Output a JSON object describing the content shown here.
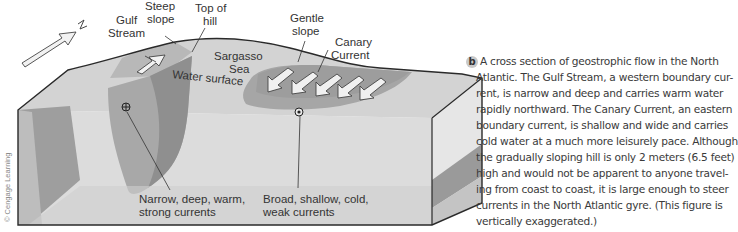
{
  "figure": {
    "labels": {
      "north_arrow": "N",
      "gulf_stream": [
        "Gulf",
        "Stream"
      ],
      "steep_slope": [
        "Steep",
        "slope"
      ],
      "top_of_hill": [
        "Top of",
        "hill"
      ],
      "gentle_slope": [
        "Gentle",
        "slope"
      ],
      "canary_current": [
        "Canary",
        "Current"
      ],
      "sargasso_sea": [
        "Sargasso",
        "Sea"
      ],
      "water_surface": "Water surface",
      "gulf_stream_desc": [
        "Narrow, deep, warm,",
        "strong currents"
      ],
      "canary_current_desc": [
        "Broad, shallow, cold,",
        "weak currents"
      ]
    },
    "symbols": {
      "into_page": "circle-cross-icon",
      "out_of_page": "circle-dot-icon"
    },
    "credit": "© Cengage Learning",
    "colors": {
      "block_top": "#d4d4d4",
      "block_light": "#e0e0e0",
      "block_dark": "#9c9c9c",
      "current_mid": "#b0b0b0",
      "outline": "#2a2a2a"
    }
  },
  "caption": {
    "badge": "b",
    "lines": [
      "A cross section of geostrophic flow in the North",
      "Atlantic. The Gulf Stream, a western boundary cur-",
      "rent, is narrow and deep and carries warm water",
      "rapidly northward. The Canary Current, an eastern",
      "boundary current, is shallow and wide and carries",
      "cold water at a much more leisurely pace. Although",
      "the gradually sloping hill is only 2 meters (6.5 feet)",
      "high and would not be apparent to anyone travel-",
      "ing from coast to coast, it is large enough to steer",
      "currents in the North Atlantic gyre. (This figure is",
      "vertically exaggerated.)"
    ]
  }
}
